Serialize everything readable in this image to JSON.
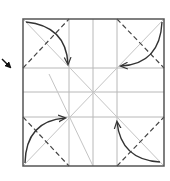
{
  "diagram": {
    "type": "origami-fold-instruction",
    "colors": {
      "background": "#ffffff",
      "border": "#555555",
      "crease": "#b8b8b8",
      "valley_fold": "#444444",
      "arrow": "#333333",
      "pointer": "#111111"
    },
    "square": {
      "x": 23,
      "y": 19,
      "size": 144
    },
    "grid_lines": {
      "vertical_x": [
        69,
        93,
        117
      ],
      "horizontal_y": [
        68,
        92,
        117
      ]
    },
    "crease_diagonals": [
      {
        "x1": 23,
        "y1": 19,
        "x2": 164,
        "y2": 166
      },
      {
        "x1": 164,
        "y1": 19,
        "x2": 23,
        "y2": 166
      },
      {
        "x1": 49,
        "y1": 74,
        "x2": 93,
        "y2": 166
      }
    ],
    "dashed_folds": [
      {
        "name": "top-left",
        "x1": 23,
        "y1": 68,
        "x2": 69,
        "y2": 19
      },
      {
        "name": "top-right",
        "x1": 117,
        "y1": 19,
        "x2": 164,
        "y2": 68
      },
      {
        "name": "bottom-left",
        "x1": 23,
        "y1": 117,
        "x2": 69,
        "y2": 166
      },
      {
        "name": "bottom-right",
        "x1": 117,
        "y1": 166,
        "x2": 164,
        "y2": 117
      }
    ],
    "fold_arrows": [
      {
        "name": "top-left",
        "from": "corner",
        "path": "M26 22 Q66 26 68 64"
      },
      {
        "name": "top-right",
        "from": "corner",
        "path": "M162 22 Q160 64 121 66"
      },
      {
        "name": "bottom-left",
        "from": "corner",
        "path": "M25 163 Q26 121 65 118"
      },
      {
        "name": "bottom-right",
        "from": "corner",
        "path": "M160 162 Q121 160 117 122"
      }
    ],
    "pointer_arrow": {
      "label": "turn-over-pointer",
      "x1": 2,
      "y1": 59,
      "x2": 11,
      "y2": 68
    }
  }
}
